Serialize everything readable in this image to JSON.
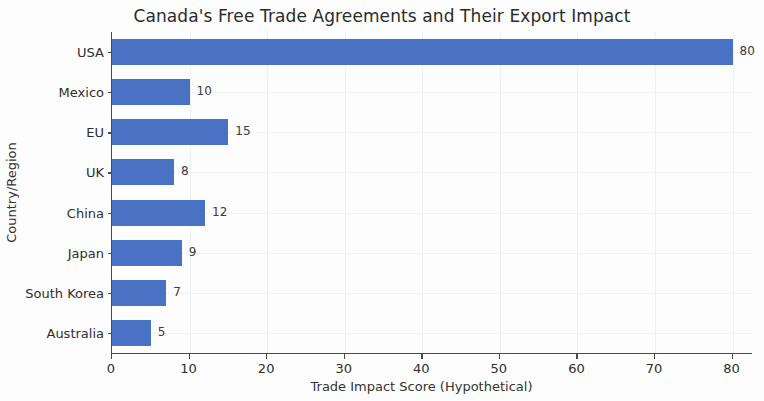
{
  "chart_data": {
    "type": "bar",
    "orientation": "horizontal",
    "title": "Canada's Free Trade Agreements and Their Export Impact",
    "xlabel": "Trade Impact Score (Hypothetical)",
    "ylabel": "Country/Region",
    "categories": [
      "USA",
      "Mexico",
      "EU",
      "UK",
      "China",
      "Japan",
      "South Korea",
      "Australia"
    ],
    "values": [
      80,
      10,
      15,
      8,
      12,
      9,
      7,
      5
    ],
    "value_labels": [
      "80",
      "10",
      "15",
      "8",
      "12",
      "9",
      "7",
      "5"
    ],
    "xticks": [
      0,
      10,
      20,
      30,
      40,
      50,
      60,
      70,
      80
    ],
    "xtick_labels": [
      "0",
      "10",
      "20",
      "30",
      "40",
      "50",
      "60",
      "70",
      "80"
    ],
    "xlim": [
      0,
      82.5
    ],
    "grid": true,
    "legend": null,
    "bar_color": "#4a72c4",
    "axis_color": "#4a4a4a",
    "grid_color": "#f0f0f2",
    "background": "#fdfdfd"
  }
}
